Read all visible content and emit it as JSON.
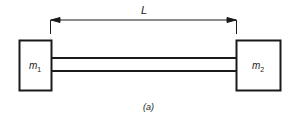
{
  "diagram": {
    "dimension_label": "L",
    "mass_left": {
      "symbol": "m",
      "subscript": "1"
    },
    "mass_right": {
      "symbol": "m",
      "subscript": "2"
    },
    "caption": "(a)",
    "stroke_color": "#1a1a1a"
  }
}
